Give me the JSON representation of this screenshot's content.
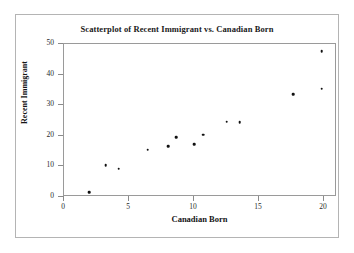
{
  "chart_data": {
    "type": "scatter",
    "title": "Scatterplot of Recent Immigrant vs. Canadian Born",
    "xlabel": "Canadian Born",
    "ylabel": "Recent Immigrant",
    "xlim": [
      0,
      21
    ],
    "ylim": [
      0,
      50
    ],
    "xticks": [
      0,
      5,
      10,
      15,
      20
    ],
    "yticks": [
      0,
      10,
      20,
      30,
      40,
      50
    ],
    "xtick_labels": [
      "0",
      "5",
      "10",
      "15",
      "20"
    ],
    "ytick_labels": [
      "0",
      "10",
      "20",
      "30",
      "40",
      "50"
    ],
    "grid": false,
    "legend": false,
    "marker": "filled-circle",
    "marker_color": "#111111",
    "points": [
      {
        "x": 2.0,
        "y": 1.3
      },
      {
        "x": 3.3,
        "y": 10.0
      },
      {
        "x": 4.3,
        "y": 8.9
      },
      {
        "x": 6.5,
        "y": 15.1
      },
      {
        "x": 8.1,
        "y": 16.3
      },
      {
        "x": 8.7,
        "y": 19.3
      },
      {
        "x": 10.1,
        "y": 17.0
      },
      {
        "x": 10.8,
        "y": 20.0
      },
      {
        "x": 12.6,
        "y": 24.3
      },
      {
        "x": 13.6,
        "y": 24.1
      },
      {
        "x": 17.7,
        "y": 33.2
      },
      {
        "x": 19.9,
        "y": 35.0
      },
      {
        "x": 19.9,
        "y": 47.3
      }
    ]
  },
  "figure": {
    "background_color": "#ffffff",
    "frame_color": "#b4b4b4",
    "axes_color": "#9a9a9a"
  }
}
